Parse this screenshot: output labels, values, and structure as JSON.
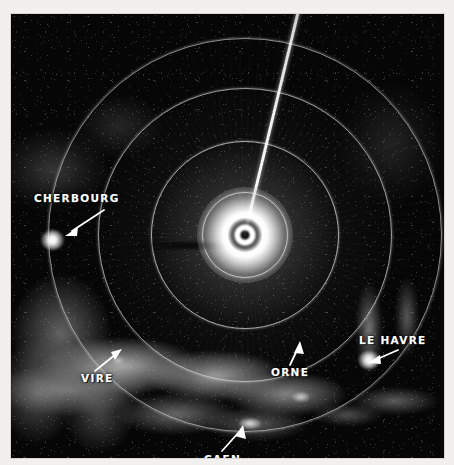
{
  "image": {
    "kind": "radar-ppi-scope-photograph",
    "subject": "Normandy coast radar plan-position-indicator display",
    "frame": {
      "left": 11,
      "top": 14,
      "width": 433,
      "height": 444
    },
    "background_color": "#060606",
    "paper_color": "#f4f2f0",
    "trace_color": "#ffffff"
  },
  "scope": {
    "center": {
      "x_pct": 54.0,
      "y_pct": 49.8
    },
    "sweep": {
      "name": "sweep-trace",
      "bearing_deg": 193.5,
      "length_px": 246
    },
    "origin_blip": {
      "name": "origin-burn",
      "description": "saturated centre origin burn with dark pinhole core"
    },
    "range_rings": [
      {
        "id": 1,
        "diameter_px": 84
      },
      {
        "id": 2,
        "diameter_px": 186
      },
      {
        "id": 3,
        "diameter_px": 292
      },
      {
        "id": 4,
        "diameter_px": 392
      }
    ]
  },
  "annotations": [
    {
      "id": "cherbourg",
      "label": "CHERBOURG",
      "arrow": {
        "x1": 93,
        "y1": 196,
        "x2": 56,
        "y2": 220
      }
    },
    {
      "id": "vire",
      "label": "VIRE",
      "arrow": {
        "x1": 84,
        "y1": 357,
        "x2": 109,
        "y2": 337
      }
    },
    {
      "id": "le-havre",
      "label": "LE HAVRE",
      "arrow": {
        "x1": 387,
        "y1": 337,
        "x2": 360,
        "y2": 348
      }
    },
    {
      "id": "orne",
      "label": "ORNE",
      "arrow": {
        "x1": 279,
        "y1": 351,
        "x2": 288,
        "y2": 330
      }
    },
    {
      "id": "caen",
      "label": "CAEN",
      "arrow": {
        "x1": 211,
        "y1": 437,
        "x2": 231,
        "y2": 414
      }
    }
  ],
  "returns": {
    "land_masses": [
      {
        "name": "land-coast",
        "description": "Normandy coastline bright land return across the lower scope"
      },
      {
        "name": "land-west",
        "description": "western clutter toward Vire and the Cotentin base"
      },
      {
        "name": "land-east",
        "description": "Seine estuary shoreline near Le Havre"
      },
      {
        "name": "land-northwest",
        "description": "faint Cotentin peninsula return upper left"
      },
      {
        "name": "land-northeast",
        "description": "diffuse clutter upper right"
      }
    ],
    "point_targets": [
      {
        "name": "blip-cherbourg",
        "label": "CHERBOURG"
      },
      {
        "name": "blip-lehavre",
        "label": "LE HAVRE"
      },
      {
        "name": "blip-caen",
        "label": "CAEN"
      },
      {
        "name": "blip-orne",
        "label": "ORNE"
      },
      {
        "name": "blip-vire",
        "label": "VIRE"
      }
    ]
  }
}
